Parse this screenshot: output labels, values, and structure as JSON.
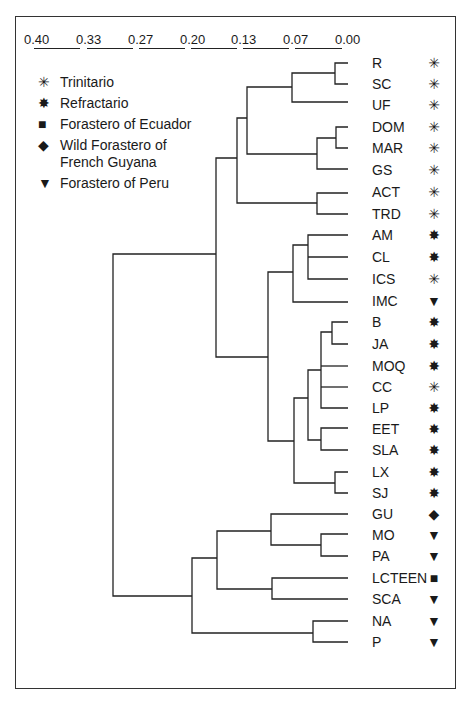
{
  "scale": {
    "labels": [
      "0.40",
      "0.33",
      "0.27",
      "0.20",
      "0.13",
      "0.07",
      "0.00"
    ]
  },
  "legend": {
    "items": [
      {
        "symbol": "✳",
        "symbol_name": "open-asterisk-icon",
        "label": "Trinitario"
      },
      {
        "symbol": "✸",
        "symbol_name": "filled-star-icon",
        "label": "Refractario"
      },
      {
        "symbol": "■",
        "symbol_name": "square-icon",
        "label": "Forastero of Ecuador"
      },
      {
        "symbol": "◆",
        "symbol_name": "diamond-icon",
        "label": "Wild Forastero of French Guyana"
      },
      {
        "symbol": "▼",
        "symbol_name": "down-triangle-icon",
        "label": "Forastero of Peru"
      }
    ]
  },
  "leaves": [
    {
      "label": "R",
      "group": "Trinitario",
      "symbol": "✳"
    },
    {
      "label": "SC",
      "group": "Trinitario",
      "symbol": "✳"
    },
    {
      "label": "UF",
      "group": "Trinitario",
      "symbol": "✳"
    },
    {
      "label": "DOM",
      "group": "Trinitario",
      "symbol": "✳"
    },
    {
      "label": "MAR",
      "group": "Trinitario",
      "symbol": "✳"
    },
    {
      "label": "GS",
      "group": "Trinitario",
      "symbol": "✳"
    },
    {
      "label": "ACT",
      "group": "Trinitario",
      "symbol": "✳"
    },
    {
      "label": "TRD",
      "group": "Trinitario",
      "symbol": "✳"
    },
    {
      "label": "AM",
      "group": "Refractario",
      "symbol": "✸"
    },
    {
      "label": "CL",
      "group": "Refractario",
      "symbol": "✸"
    },
    {
      "label": "ICS",
      "group": "Trinitario",
      "symbol": "✳"
    },
    {
      "label": "IMC",
      "group": "Forastero of Peru",
      "symbol": "▼"
    },
    {
      "label": "B",
      "group": "Refractario",
      "symbol": "✸"
    },
    {
      "label": "JA",
      "group": "Refractario",
      "symbol": "✸"
    },
    {
      "label": "MOQ",
      "group": "Refractario",
      "symbol": "✸"
    },
    {
      "label": "CC",
      "group": "Trinitario",
      "symbol": "✳"
    },
    {
      "label": "LP",
      "group": "Refractario",
      "symbol": "✸"
    },
    {
      "label": "EET",
      "group": "Refractario",
      "symbol": "✸"
    },
    {
      "label": "SLA",
      "group": "Refractario",
      "symbol": "✸"
    },
    {
      "label": "LX",
      "group": "Refractario",
      "symbol": "✸"
    },
    {
      "label": "SJ",
      "group": "Refractario",
      "symbol": "✸"
    },
    {
      "label": "GU",
      "group": "Wild Forastero of French Guyana",
      "symbol": "◆"
    },
    {
      "label": "MO",
      "group": "Forastero of Peru",
      "symbol": "▼"
    },
    {
      "label": "PA",
      "group": "Forastero of Peru",
      "symbol": "▼"
    },
    {
      "label": "LCTEEN",
      "group": "Forastero of Ecuador",
      "symbol": "■"
    },
    {
      "label": "SCA",
      "group": "Forastero of Peru",
      "symbol": "▼"
    },
    {
      "label": "NA",
      "group": "Forastero of Peru",
      "symbol": "▼"
    },
    {
      "label": "P",
      "group": "Forastero of Peru",
      "symbol": "▼"
    }
  ],
  "colors": {
    "line": "#222222",
    "background": "#ffffff"
  }
}
